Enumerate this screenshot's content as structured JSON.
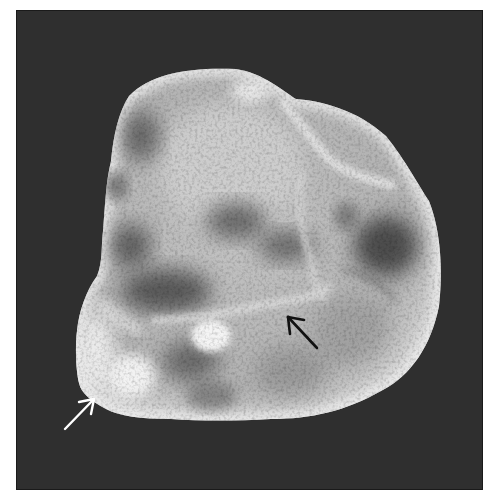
{
  "image": {
    "subject": "Gross photograph of a sectioned lobulated specimen on a dark background",
    "background_color": "#2f2f2f",
    "frame_color": "#ffffff",
    "specimen_base_color": "#b9b9b9",
    "highlight_color": "#f2f2f2",
    "shadow_color": "#5c5c5c"
  },
  "annotations": [
    {
      "name": "white-arrow",
      "color": "#ffffff",
      "direction": "up-right",
      "tip": [
        93,
        398
      ],
      "tail": [
        64,
        428
      ]
    },
    {
      "name": "black-arrow",
      "color": "#111111",
      "direction": "up-left",
      "tip": [
        287,
        313
      ],
      "tail": [
        316,
        347
      ]
    }
  ]
}
